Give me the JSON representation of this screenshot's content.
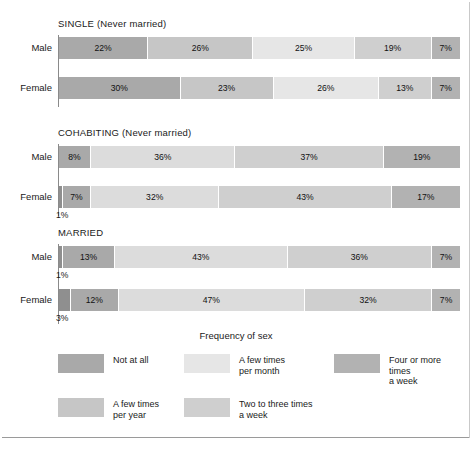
{
  "chart_data": {
    "type": "bar",
    "orientation": "horizontal",
    "stacked": true,
    "stacked_percent": true,
    "title": "",
    "legend_title": "Frequency of sex",
    "legend_position": "bottom",
    "grid": false,
    "xlabel": "",
    "ylabel": "",
    "xlim": [
      0,
      100
    ],
    "categories": [
      "Not at all",
      "A few times per year",
      "A few times per month",
      "Two to three times a week",
      "Four or more times a week"
    ],
    "category_colors": [
      "#a9a9a9",
      "#c6c6c6",
      "#e6e6e6",
      "#cfcfcf",
      "#b2b2b2"
    ],
    "groups": [
      {
        "name": "SINGLE (Never married)",
        "rows": [
          {
            "label": "Male",
            "values": [
              22,
              26,
              25,
              19,
              7
            ]
          },
          {
            "label": "Female",
            "values": [
              30,
              23,
              26,
              13,
              7
            ]
          }
        ]
      },
      {
        "name": "COHABITING (Never married)",
        "rows": [
          {
            "label": "Male",
            "values": [
              8,
              36,
              37,
              19
            ]
          },
          {
            "label": "Female",
            "values": [
              1,
              7,
              32,
              43,
              17
            ]
          }
        ]
      },
      {
        "name": "MARRIED",
        "rows": [
          {
            "label": "Male",
            "values": [
              1,
              13,
              43,
              36,
              7
            ]
          },
          {
            "label": "Female",
            "values": [
              3,
              12,
              47,
              32,
              7
            ]
          }
        ]
      }
    ]
  },
  "sections": [
    {
      "title": "SINGLE (Never married)",
      "rows": [
        {
          "label": "Male",
          "callout": "",
          "segments": [
            {
              "label": "22%",
              "pct": 22,
              "color": "#a9a9a9"
            },
            {
              "label": "26%",
              "pct": 26,
              "color": "#c6c6c6"
            },
            {
              "label": "25%",
              "pct": 25,
              "color": "#e6e6e6"
            },
            {
              "label": "19%",
              "pct": 19,
              "color": "#cfcfcf"
            },
            {
              "label": "7%",
              "pct": 7,
              "color": "#b2b2b2"
            }
          ]
        },
        {
          "label": "Female",
          "callout": "",
          "segments": [
            {
              "label": "30%",
              "pct": 30,
              "color": "#a9a9a9"
            },
            {
              "label": "23%",
              "pct": 23,
              "color": "#c6c6c6"
            },
            {
              "label": "26%",
              "pct": 26,
              "color": "#e6e6e6"
            },
            {
              "label": "13%",
              "pct": 13,
              "color": "#cfcfcf"
            },
            {
              "label": "7%",
              "pct": 7,
              "color": "#b2b2b2"
            }
          ]
        }
      ]
    },
    {
      "title": "COHABITING (Never married)",
      "rows": [
        {
          "label": "Male",
          "callout": "",
          "segments": [
            {
              "label": "8%",
              "pct": 8,
              "color": "#a9a9a9"
            },
            {
              "label": "36%",
              "pct": 36,
              "color": "#dcdcdc"
            },
            {
              "label": "37%",
              "pct": 37,
              "color": "#cfcfcf"
            },
            {
              "label": "19%",
              "pct": 19,
              "color": "#b2b2b2"
            }
          ]
        },
        {
          "label": "Female",
          "callout": "1%",
          "segments": [
            {
              "label": "",
              "pct": 1,
              "color": "#8f8f8f"
            },
            {
              "label": "7%",
              "pct": 7,
              "color": "#a9a9a9"
            },
            {
              "label": "32%",
              "pct": 32,
              "color": "#dcdcdc"
            },
            {
              "label": "43%",
              "pct": 43,
              "color": "#cfcfcf"
            },
            {
              "label": "17%",
              "pct": 17,
              "color": "#b2b2b2"
            }
          ]
        }
      ]
    },
    {
      "title": "MARRIED",
      "rows": [
        {
          "label": "Male",
          "callout": "1%",
          "segments": [
            {
              "label": "",
              "pct": 1,
              "color": "#8f8f8f"
            },
            {
              "label": "13%",
              "pct": 13,
              "color": "#a9a9a9"
            },
            {
              "label": "43%",
              "pct": 43,
              "color": "#dcdcdc"
            },
            {
              "label": "36%",
              "pct": 36,
              "color": "#cfcfcf"
            },
            {
              "label": "7%",
              "pct": 7,
              "color": "#b2b2b2"
            }
          ]
        },
        {
          "label": "Female",
          "callout": "3%",
          "segments": [
            {
              "label": "",
              "pct": 3,
              "color": "#8f8f8f"
            },
            {
              "label": "12%",
              "pct": 12,
              "color": "#a9a9a9"
            },
            {
              "label": "47%",
              "pct": 47,
              "color": "#dcdcdc"
            },
            {
              "label": "32%",
              "pct": 32,
              "color": "#cfcfcf"
            },
            {
              "label": "7%",
              "pct": 7,
              "color": "#b2b2b2"
            }
          ]
        }
      ]
    }
  ],
  "legend": {
    "title": "Frequency of sex",
    "items": [
      {
        "label": "Not at all",
        "color": "#a9a9a9"
      },
      {
        "label": "A few times\nper month",
        "color": "#e6e6e6"
      },
      {
        "label": "Four or more times\na week",
        "color": "#b2b2b2"
      },
      {
        "label": "A few times\nper year",
        "color": "#c6c6c6"
      },
      {
        "label": "Two to three times\na week",
        "color": "#cfcfcf"
      }
    ]
  }
}
